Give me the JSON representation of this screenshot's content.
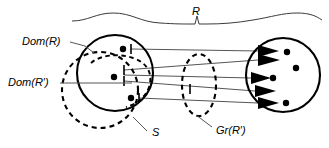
{
  "figure": {
    "background_color": "#ffffff",
    "ink_color": "#000000",
    "line_color": "#555555",
    "width": 329,
    "height": 148,
    "labels": {
      "relation": "R",
      "domain_r": "Dom(R)",
      "domain_r_prime": "Dom(R′)",
      "set_s": "S",
      "graph_r_prime": "Gr(R′)"
    },
    "label_positions": {
      "relation": {
        "x": 196,
        "y": 12
      },
      "domain_r": {
        "x": 22,
        "y": 42
      },
      "domain_r_prime": {
        "x": 8,
        "y": 83
      },
      "set_s": {
        "x": 152,
        "y": 133
      },
      "graph_r_prime": {
        "x": 216,
        "y": 131
      }
    },
    "shapes": {
      "domain_circle": {
        "cx": 115,
        "cy": 73,
        "r": 38,
        "style": "solid"
      },
      "set_s_circle": {
        "cx": 100,
        "cy": 90,
        "r": 38,
        "style": "dashed"
      },
      "codomain_circle": {
        "cx": 283,
        "cy": 75,
        "r": 37,
        "style": "solid"
      },
      "graph_ellipse": {
        "cx": 199,
        "cy": 85,
        "rx": 17,
        "ry": 31,
        "style": "dashed"
      },
      "domain_r_prime_arc": {
        "cx": 128,
        "cy": 80,
        "rx": 28,
        "ry": 22,
        "style": "dashed"
      }
    },
    "domain_points": [
      {
        "id": "p1",
        "x": 123,
        "y": 49
      },
      {
        "id": "p2",
        "x": 114,
        "y": 77
      },
      {
        "id": "p3",
        "x": 131,
        "y": 98
      }
    ],
    "codomain_points": [
      {
        "id": "q1",
        "x": 287,
        "y": 52
      },
      {
        "id": "q2",
        "x": 295,
        "y": 68
      },
      {
        "id": "q3",
        "x": 272,
        "y": 78
      },
      {
        "id": "q4",
        "x": 285,
        "y": 103
      }
    ],
    "arrow_count": 5,
    "mappings": [
      {
        "from": "p1",
        "to_y": 51
      },
      {
        "from": "p2",
        "to_y": 60
      },
      {
        "from": "p2",
        "to_y": 78
      },
      {
        "from": "p2",
        "to_y": 91
      },
      {
        "from": "p3",
        "to_y": 103
      }
    ]
  }
}
